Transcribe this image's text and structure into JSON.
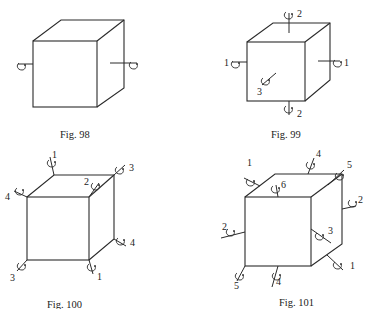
{
  "figures": [
    {
      "id": "fig98",
      "caption": "Fig. 98",
      "description": "Cube with one rotation axis through centres of left and right faces",
      "axis_labels": []
    },
    {
      "id": "fig99",
      "caption": "Fig. 99",
      "description": "Cube with three rotation axes through centres of opposite faces",
      "axis_labels": [
        "1",
        "1",
        "2",
        "2",
        "3"
      ]
    },
    {
      "id": "fig100",
      "caption": "Fig. 100",
      "description": "Cube with four rotation axes through opposite vertices",
      "axis_labels": [
        "1",
        "2",
        "3",
        "4",
        "4",
        "3",
        "1"
      ]
    },
    {
      "id": "fig101",
      "caption": "Fig. 101",
      "description": "Cube with six rotation axes through midpoints of opposite edges",
      "axis_labels": [
        "1",
        "4",
        "5",
        "6",
        "2",
        "2",
        "3",
        "1",
        "5",
        "4"
      ]
    }
  ],
  "icons": {
    "rotation_arrow": "curved-rotation-arrow-icon"
  }
}
